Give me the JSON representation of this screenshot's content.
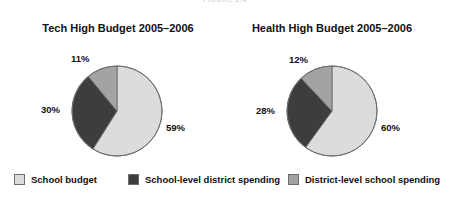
{
  "figure": {
    "running_head": "FIGURE 2.4",
    "background": "#ffffff"
  },
  "colors": {
    "light_gray": "#dcdcdc",
    "dark_gray": "#3d3d3d",
    "medium_gray": "#a3a3a3",
    "outline": "#6d6d6d",
    "text": "#111111"
  },
  "charts": [
    {
      "id": "tech-high",
      "title": "Tech High Budget 2005–2006",
      "labels": [
        "59%",
        "30%",
        "11%"
      ]
    },
    {
      "id": "health-high",
      "title": "Health High Budget 2005–2006",
      "labels": [
        "60%",
        "28%",
        "12%"
      ]
    }
  ],
  "legend": {
    "items": [
      {
        "label": "School budget",
        "color": "#dcdcdc",
        "swatch": "light-gray-swatch"
      },
      {
        "label": "School-level district spending",
        "color": "#3d3d3d",
        "swatch": "dark-gray-swatch"
      },
      {
        "label": "District-level school spending",
        "color": "#a3a3a3",
        "swatch": "medium-gray-swatch"
      }
    ]
  },
  "chart_data": [
    {
      "type": "pie",
      "title": "Tech High Budget 2005–2006",
      "categories": [
        "School budget",
        "School-level district spending",
        "District-level school spending"
      ],
      "values": [
        59,
        30,
        11
      ],
      "value_labels": [
        "59%",
        "30%",
        "11%"
      ],
      "colors": [
        "#dcdcdc",
        "#3d3d3d",
        "#a3a3a3"
      ],
      "start_angle_deg": 0,
      "direction": "clockwise",
      "units": "percent",
      "legend_position": "bottom",
      "grid": false
    },
    {
      "type": "pie",
      "title": "Health High Budget 2005–2006",
      "categories": [
        "School budget",
        "School-level district spending",
        "District-level school spending"
      ],
      "values": [
        60,
        28,
        12
      ],
      "value_labels": [
        "60%",
        "28%",
        "12%"
      ],
      "colors": [
        "#dcdcdc",
        "#3d3d3d",
        "#a3a3a3"
      ],
      "start_angle_deg": 0,
      "direction": "clockwise",
      "units": "percent",
      "legend_position": "bottom",
      "grid": false
    }
  ]
}
